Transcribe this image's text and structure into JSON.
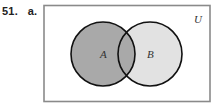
{
  "problem": {
    "number": "51.",
    "part": "a."
  },
  "venn": {
    "universe_label": "U",
    "sets": [
      {
        "label": "A",
        "shading": "shaded"
      },
      {
        "label": "B",
        "shading": "light"
      }
    ],
    "shaded_region": "A",
    "colors": {
      "frame": "#8a8a8a",
      "a_fill": "#a9a9a9",
      "b_fill": "#e2e2e2",
      "outline": "#111111",
      "background": "#ffffff"
    }
  }
}
